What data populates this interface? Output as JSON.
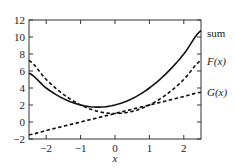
{
  "chart_data": {
    "type": "line",
    "title": "",
    "xlabel": "x",
    "ylabel": "",
    "xlim": [
      -2.5,
      2.5
    ],
    "ylim": [
      -2,
      12
    ],
    "x_ticks": [
      -2,
      -1,
      0,
      1,
      2
    ],
    "x_tick_labels": [
      "−2",
      "−1",
      "0",
      "1",
      "2"
    ],
    "y_ticks": [
      -2,
      0,
      2,
      4,
      6,
      8,
      10,
      12
    ],
    "y_tick_labels": [
      "−2",
      "0",
      "2",
      "4",
      "6",
      "8",
      "10",
      "12"
    ],
    "grid": false,
    "legend_position": "right-inline-labels",
    "x": [
      -2.5,
      -2.0,
      -1.5,
      -1.0,
      -0.5,
      0.0,
      0.5,
      1.0,
      1.5,
      2.0,
      2.5
    ],
    "series": [
      {
        "name": "sum",
        "style": "solid",
        "values": [
          5.75,
          4.0,
          2.75,
          2.0,
          1.75,
          2.0,
          2.75,
          4.0,
          5.75,
          8.0,
          10.75
        ]
      },
      {
        "name": "F(x)",
        "style": "dashed",
        "values": [
          7.25,
          5.0,
          3.25,
          2.0,
          1.25,
          1.0,
          1.25,
          2.0,
          3.25,
          5.0,
          7.25
        ]
      },
      {
        "name": "G(x)",
        "style": "dashed",
        "values": [
          -1.5,
          -1.0,
          -0.5,
          0.0,
          0.5,
          1.0,
          1.5,
          2.0,
          2.5,
          3.0,
          3.5
        ]
      }
    ],
    "annotations": [
      {
        "text": "sum",
        "near": "right end of solid curve"
      },
      {
        "text": "F(x)",
        "near": "right end of upper dashed curve"
      },
      {
        "text": "G(x)",
        "near": "right end of lower dashed line"
      }
    ]
  },
  "labels": {
    "xlabel": "x",
    "sum": "sum",
    "F": "F(x)",
    "G": "G(x)"
  },
  "colors": {
    "axis": "#333333",
    "lines": "#111111",
    "background": "#ffffff"
  }
}
